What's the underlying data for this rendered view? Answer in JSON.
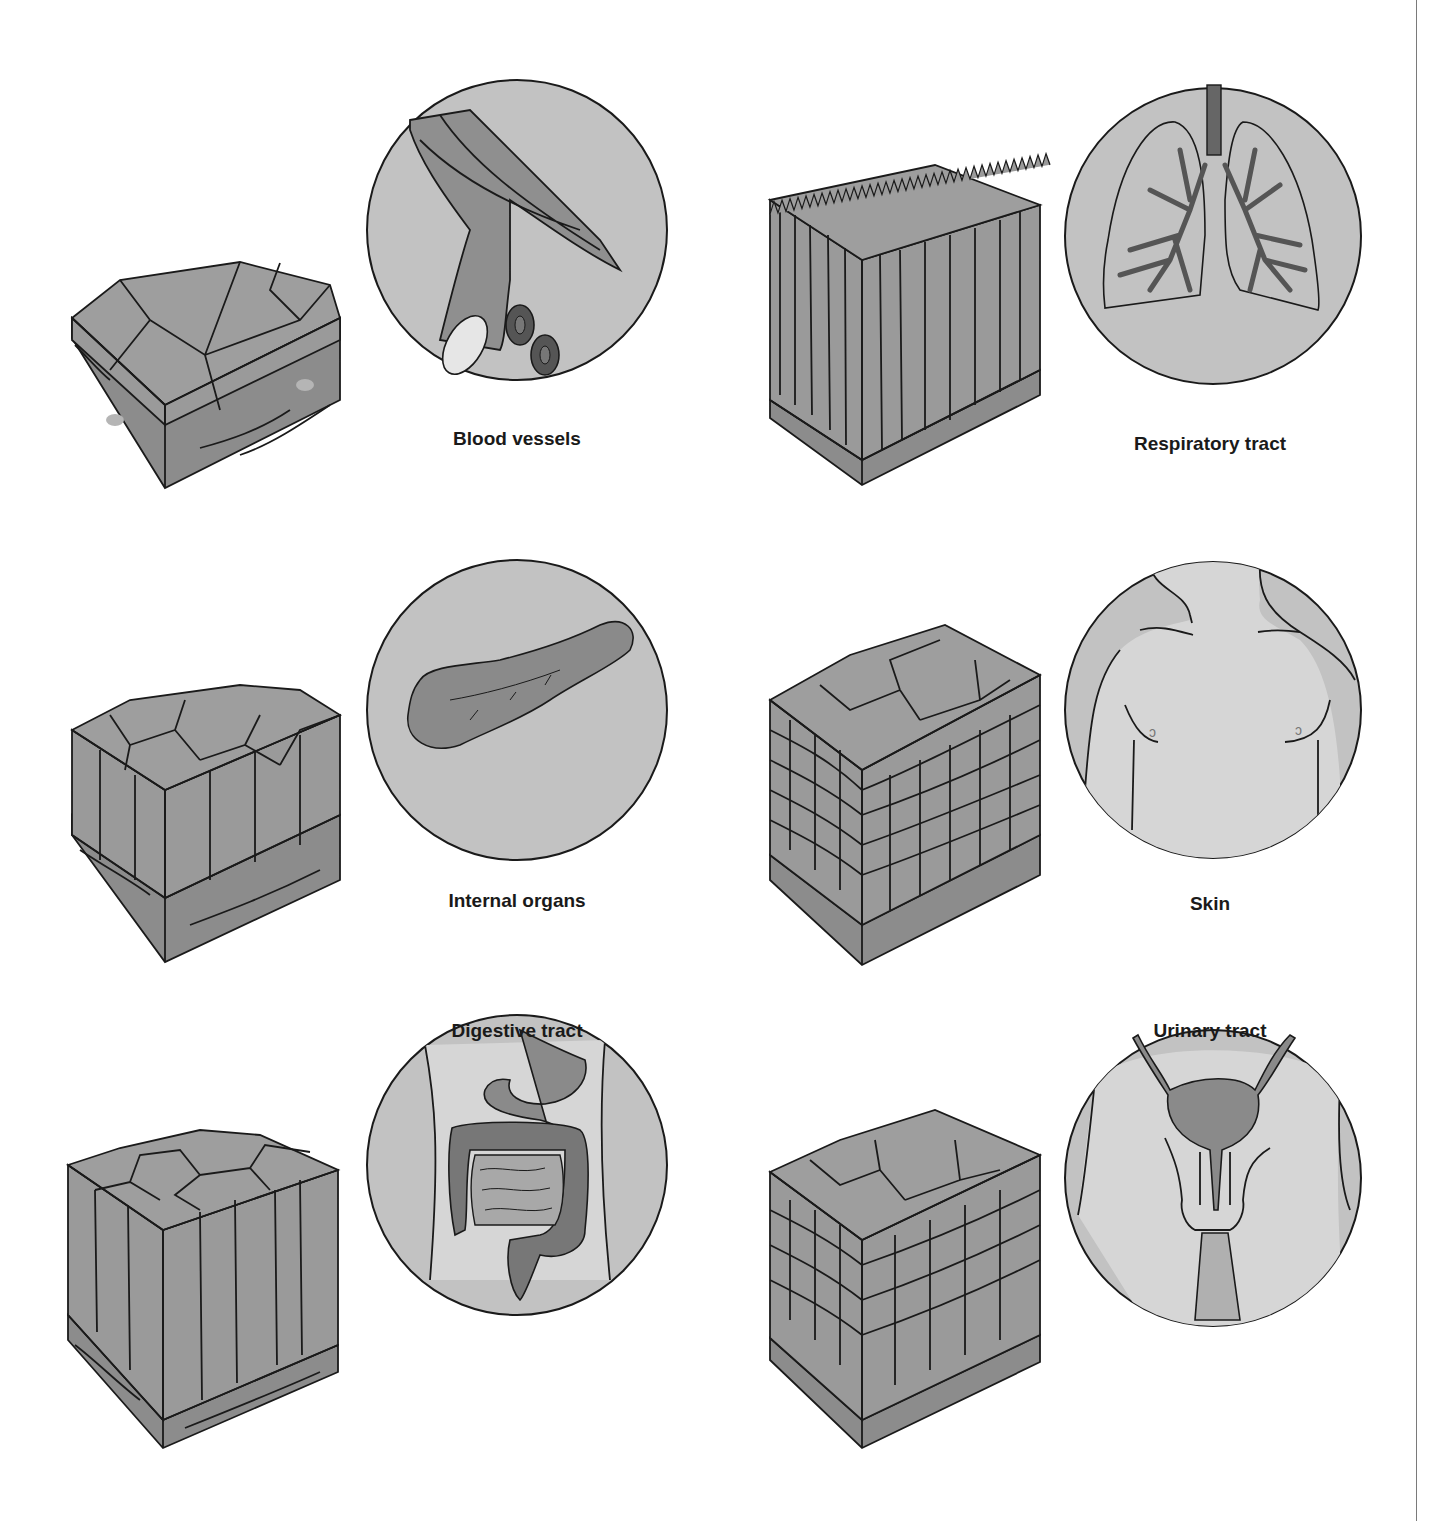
{
  "figure": {
    "panels": [
      {
        "id": "simple-squamous",
        "label": "Blood vessels",
        "tissue": "simple squamous epithelium",
        "organ_icon": "blood-vessel-icon"
      },
      {
        "id": "pseudostratified-ciliated",
        "label": "Respiratory tract",
        "tissue": "pseudostratified ciliated columnar epithelium",
        "organ_icon": "lungs-icon"
      },
      {
        "id": "simple-cuboidal",
        "label": "Internal organs",
        "tissue": "simple cuboidal epithelium",
        "organ_icon": "pancreas-icon"
      },
      {
        "id": "stratified-squamous",
        "label": "Skin",
        "tissue": "stratified squamous epithelium",
        "organ_icon": "torso-icon"
      },
      {
        "id": "simple-columnar",
        "label": "Digestive tract",
        "tissue": "simple columnar epithelium",
        "organ_icon": "intestines-icon"
      },
      {
        "id": "transitional",
        "label": "Urinary tract",
        "tissue": "transitional epithelium",
        "organ_icon": "bladder-icon"
      }
    ]
  },
  "colors": {
    "cell_fill": "#9e9e9e",
    "connective": "#8c8c8c",
    "circle_bg": "#c2c2c2",
    "body_light": "#d6d6d6",
    "organ_dark": "#8a8a8a",
    "outline": "#1a1a1a"
  }
}
